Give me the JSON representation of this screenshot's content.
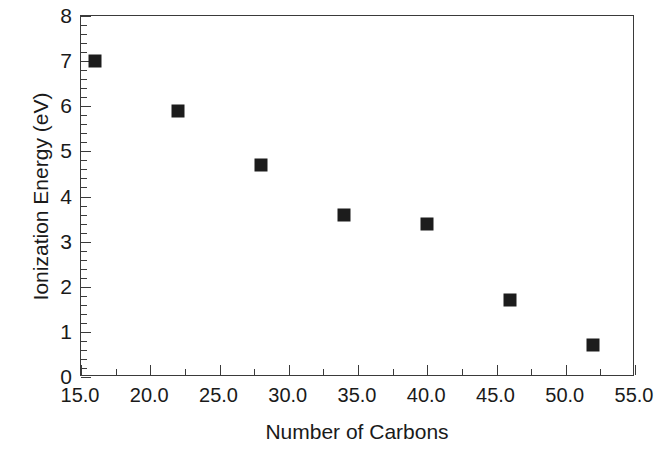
{
  "chart_data": {
    "type": "scatter",
    "title": "",
    "xlabel": "Number of Carbons",
    "ylabel": "Ionization Energy (eV)",
    "xlim": [
      15.0,
      55.0
    ],
    "ylim": [
      0,
      8
    ],
    "grid": false,
    "legend": null,
    "marker_style": "filled-square",
    "marker_color": "#1c1c1c",
    "x": [
      16,
      22,
      28,
      34,
      40,
      46,
      52
    ],
    "y": [
      7.0,
      5.9,
      4.7,
      3.6,
      3.4,
      1.7,
      0.7
    ],
    "series": [
      {
        "name": "Ionization Energy",
        "points": [
          {
            "x": 16,
            "y": 7.0
          },
          {
            "x": 22,
            "y": 5.9
          },
          {
            "x": 28,
            "y": 4.7
          },
          {
            "x": 34,
            "y": 3.6
          },
          {
            "x": 40,
            "y": 3.4
          },
          {
            "x": 46,
            "y": 1.7
          },
          {
            "x": 52,
            "y": 0.7
          }
        ]
      }
    ],
    "x_ticks": [
      {
        "value": 15.0,
        "label": "15.0"
      },
      {
        "value": 20.0,
        "label": "20.0"
      },
      {
        "value": 25.0,
        "label": "25.0"
      },
      {
        "value": 30.0,
        "label": "30.0"
      },
      {
        "value": 35.0,
        "label": "35.0"
      },
      {
        "value": 40.0,
        "label": "40.0"
      },
      {
        "value": 45.0,
        "label": "45.0"
      },
      {
        "value": 50.0,
        "label": "50.0"
      },
      {
        "value": 55.0,
        "label": "55.0"
      }
    ],
    "x_minor_step": 2.5,
    "y_ticks": [
      {
        "value": 0,
        "label": "0"
      },
      {
        "value": 1,
        "label": "1"
      },
      {
        "value": 2,
        "label": "2"
      },
      {
        "value": 3,
        "label": "3"
      },
      {
        "value": 4,
        "label": "4"
      },
      {
        "value": 5,
        "label": "5"
      },
      {
        "value": 6,
        "label": "6"
      },
      {
        "value": 7,
        "label": "7"
      },
      {
        "value": 8,
        "label": "8"
      }
    ],
    "y_minor_step": 0.2,
    "axis_color": "#3a3a3a",
    "background_color": "#ffffff"
  }
}
